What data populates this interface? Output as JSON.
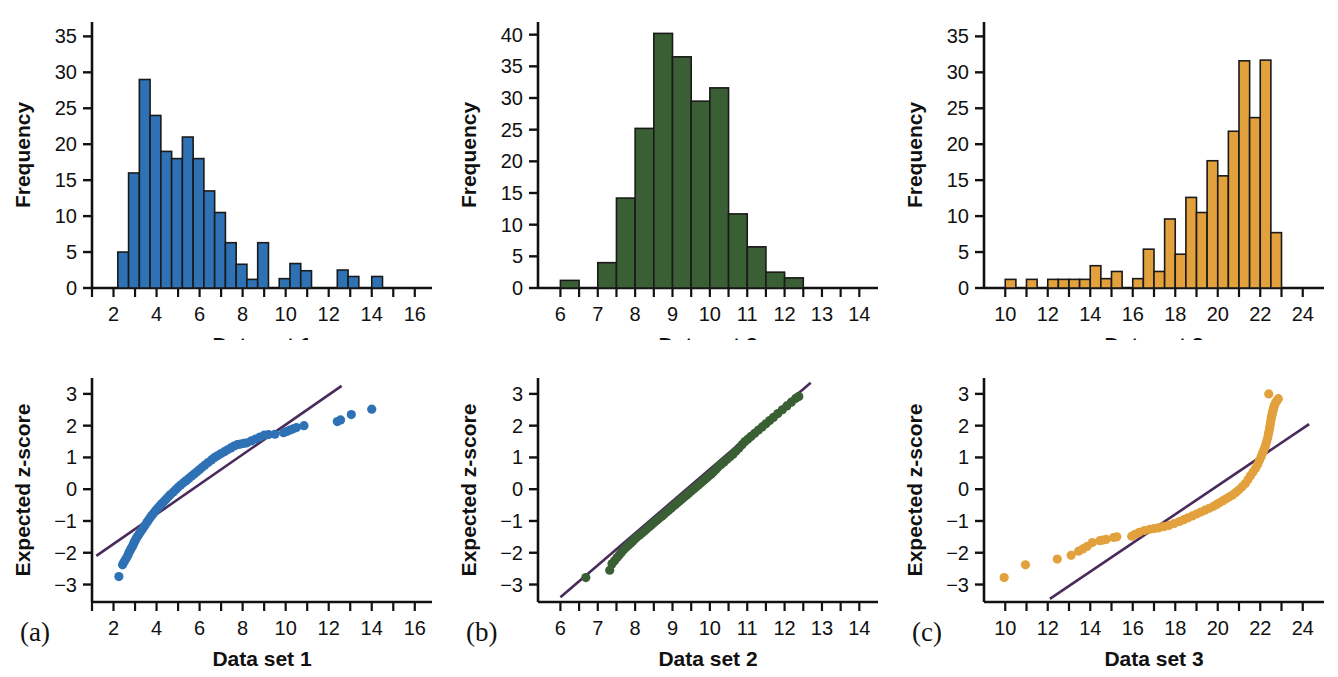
{
  "figure": {
    "panel_labels": [
      "(a)",
      "(b)",
      "(c)"
    ],
    "colors": {
      "dataset1": "#2E72B5",
      "dataset2": "#3A5F34",
      "dataset3": "#E2A13C",
      "bar_edge": "#1A1A1A",
      "reference_line": "#4A2A5A",
      "axis": "#111111"
    }
  },
  "chart_data": [
    {
      "type": "bar",
      "id": "histogram-1",
      "title": "",
      "xlabel": "Data set 1",
      "ylabel": "Frequency",
      "xlim": [
        1.0,
        16.8
      ],
      "ylim": [
        0,
        37
      ],
      "xticks": [
        2,
        4,
        6,
        8,
        10,
        12,
        14,
        16
      ],
      "xminorticks": [
        1,
        2,
        3,
        4,
        5,
        6,
        7,
        8,
        9,
        10,
        11,
        12,
        13,
        14,
        15,
        16
      ],
      "yticks": [
        0,
        5,
        10,
        15,
        20,
        25,
        30,
        35
      ],
      "bin_width": 0.5,
      "bin_starts": [
        2.2,
        2.7,
        3.2,
        3.7,
        4.2,
        4.7,
        5.2,
        5.7,
        6.2,
        6.7,
        7.2,
        7.7,
        8.2,
        8.7,
        9.7,
        10.2,
        10.7,
        12.4,
        12.9,
        14.0
      ],
      "values": [
        5,
        16,
        29,
        24,
        19,
        18,
        21,
        18,
        13.5,
        10.5,
        6.3,
        3.3,
        1.2,
        6.3,
        1.3,
        3.4,
        2.4,
        2.5,
        1.6,
        1.6
      ],
      "grid": false
    },
    {
      "type": "bar",
      "id": "histogram-2",
      "title": "",
      "xlabel": "Data set 2",
      "ylabel": "Frequency",
      "xlim": [
        5.4,
        14.5
      ],
      "ylim": [
        0,
        42
      ],
      "xticks": [
        6,
        7,
        8,
        9,
        10,
        11,
        12,
        13,
        14
      ],
      "xminorticks": [
        6,
        6.5,
        7,
        7.5,
        8,
        8.5,
        9,
        9.5,
        10,
        10.5,
        11,
        11.5,
        12,
        12.5,
        13,
        13.5,
        14
      ],
      "yticks": [
        0,
        5,
        10,
        15,
        20,
        25,
        30,
        35,
        40
      ],
      "bin_width": 0.5,
      "bin_starts": [
        6.0,
        7.0,
        7.5,
        8.0,
        8.5,
        9.0,
        9.5,
        10.0,
        10.5,
        11.0,
        11.5,
        12.0
      ],
      "values": [
        1.2,
        4.0,
        14.2,
        25.2,
        40.2,
        36.5,
        29.5,
        31.6,
        11.7,
        6.5,
        2.5,
        1.6
      ],
      "grid": false
    },
    {
      "type": "bar",
      "id": "histogram-3",
      "title": "",
      "xlabel": "Data set 3",
      "ylabel": "Frequency",
      "xlim": [
        9.0,
        25.0
      ],
      "ylim": [
        0,
        37
      ],
      "xticks": [
        10,
        12,
        14,
        16,
        18,
        20,
        22,
        24
      ],
      "xminorticks": [
        10,
        11,
        12,
        13,
        14,
        15,
        16,
        17,
        18,
        19,
        20,
        21,
        22,
        23,
        24
      ],
      "yticks": [
        0,
        5,
        10,
        15,
        20,
        25,
        30,
        35
      ],
      "bin_width": 0.5,
      "bin_starts": [
        10.0,
        11.0,
        12.0,
        12.5,
        13.0,
        13.5,
        14.0,
        14.5,
        15.0,
        16.0,
        16.5,
        17.0,
        17.5,
        18.0,
        18.5,
        19.0,
        19.5,
        20.0,
        20.5,
        21.0,
        21.5,
        22.0,
        22.5
      ],
      "values": [
        1.2,
        1.2,
        1.2,
        1.2,
        1.2,
        1.2,
        3.1,
        1.3,
        2.3,
        1.3,
        5.4,
        2.3,
        9.6,
        4.7,
        12.6,
        10.5,
        17.7,
        15.6,
        21.8,
        31.6,
        23.7,
        31.7,
        7.7
      ],
      "grid": false
    },
    {
      "type": "scatter",
      "id": "qqplot-1",
      "title": "",
      "xlabel": "Data set 1",
      "ylabel": "Expected z-score",
      "xlim": [
        1.0,
        16.8
      ],
      "ylim": [
        -3.55,
        3.5
      ],
      "xticks": [
        2,
        4,
        6,
        8,
        10,
        12,
        14,
        16
      ],
      "xminorticks": [
        1,
        2,
        3,
        4,
        5,
        6,
        7,
        8,
        9,
        10,
        11,
        12,
        13,
        14,
        15,
        16
      ],
      "yticks": [
        -3,
        -2,
        -1,
        0,
        1,
        2,
        3
      ],
      "reference_line": {
        "x1": 1.2,
        "y1": -2.1,
        "x2": 12.6,
        "y2": 3.25
      },
      "points_x": [
        2.25,
        2.42,
        2.48,
        2.55,
        2.62,
        2.68,
        2.72,
        2.78,
        2.82,
        2.88,
        2.92,
        2.96,
        3.0,
        3.05,
        3.1,
        3.16,
        3.22,
        3.3,
        3.38,
        3.46,
        3.55,
        3.62,
        3.7,
        3.78,
        3.86,
        3.95,
        4.05,
        4.15,
        4.25,
        4.35,
        4.45,
        4.55,
        4.65,
        4.78,
        4.9,
        5.0,
        5.12,
        5.25,
        5.38,
        5.5,
        5.62,
        5.75,
        5.88,
        6.0,
        6.12,
        6.25,
        6.4,
        6.55,
        6.7,
        6.85,
        7.0,
        7.15,
        7.3,
        7.45,
        7.6,
        7.75,
        7.9,
        8.05,
        8.2,
        8.4,
        8.6,
        8.8,
        9.0,
        9.2,
        9.5,
        9.9,
        10.05,
        10.2,
        10.35,
        10.5,
        10.85,
        12.4,
        12.55,
        13.05,
        14.0
      ],
      "points_y": [
        -2.75,
        -2.38,
        -2.3,
        -2.22,
        -2.14,
        -2.06,
        -1.99,
        -1.92,
        -1.86,
        -1.8,
        -1.74,
        -1.68,
        -1.62,
        -1.56,
        -1.5,
        -1.44,
        -1.38,
        -1.3,
        -1.22,
        -1.14,
        -1.05,
        -0.98,
        -0.9,
        -0.83,
        -0.76,
        -0.68,
        -0.6,
        -0.52,
        -0.45,
        -0.38,
        -0.31,
        -0.24,
        -0.17,
        -0.09,
        -0.01,
        0.06,
        0.13,
        0.2,
        0.27,
        0.34,
        0.41,
        0.48,
        0.55,
        0.62,
        0.69,
        0.76,
        0.84,
        0.92,
        1.0,
        1.06,
        1.12,
        1.18,
        1.24,
        1.3,
        1.36,
        1.4,
        1.42,
        1.44,
        1.46,
        1.52,
        1.58,
        1.64,
        1.7,
        1.72,
        1.73,
        1.78,
        1.82,
        1.86,
        1.9,
        1.94,
        2.0,
        2.13,
        2.18,
        2.35,
        2.52
      ],
      "grid": false
    },
    {
      "type": "scatter",
      "id": "qqplot-2",
      "title": "",
      "xlabel": "Data set 2",
      "ylabel": "Expected z-score",
      "xlim": [
        5.4,
        14.5
      ],
      "ylim": [
        -3.55,
        3.5
      ],
      "xticks": [
        6,
        7,
        8,
        9,
        10,
        11,
        12,
        13,
        14
      ],
      "xminorticks": [
        6,
        6.5,
        7,
        7.5,
        8,
        8.5,
        9,
        9.5,
        10,
        10.5,
        11,
        11.5,
        12,
        12.5,
        13,
        13.5,
        14
      ],
      "yticks": [
        -3,
        -2,
        -1,
        0,
        1,
        2,
        3
      ],
      "reference_line": {
        "x1": 6.0,
        "y1": -3.4,
        "x2": 12.7,
        "y2": 3.35
      },
      "points_x": [
        6.68,
        7.32,
        7.38,
        7.45,
        7.52,
        7.58,
        7.64,
        7.7,
        7.76,
        7.82,
        7.88,
        7.94,
        8.0,
        8.06,
        8.12,
        8.18,
        8.24,
        8.3,
        8.36,
        8.42,
        8.48,
        8.54,
        8.6,
        8.66,
        8.72,
        8.78,
        8.84,
        8.9,
        8.96,
        9.02,
        9.08,
        9.14,
        9.2,
        9.26,
        9.32,
        9.38,
        9.44,
        9.5,
        9.56,
        9.62,
        9.68,
        9.74,
        9.8,
        9.86,
        9.92,
        9.98,
        10.04,
        10.1,
        10.16,
        10.22,
        10.3,
        10.38,
        10.46,
        10.54,
        10.62,
        10.7,
        10.78,
        10.86,
        10.94,
        11.02,
        11.1,
        11.2,
        11.3,
        11.4,
        11.5,
        11.6,
        11.7,
        11.82,
        11.94,
        12.06,
        12.18,
        12.3,
        12.38
      ],
      "points_y": [
        -2.78,
        -2.55,
        -2.35,
        -2.25,
        -2.15,
        -2.06,
        -1.98,
        -1.9,
        -1.83,
        -1.76,
        -1.7,
        -1.63,
        -1.56,
        -1.5,
        -1.44,
        -1.38,
        -1.32,
        -1.26,
        -1.2,
        -1.14,
        -1.08,
        -1.02,
        -0.96,
        -0.9,
        -0.84,
        -0.78,
        -0.72,
        -0.66,
        -0.6,
        -0.54,
        -0.48,
        -0.42,
        -0.36,
        -0.3,
        -0.24,
        -0.18,
        -0.12,
        -0.06,
        0.0,
        0.06,
        0.12,
        0.18,
        0.24,
        0.3,
        0.36,
        0.42,
        0.48,
        0.55,
        0.62,
        0.7,
        0.78,
        0.86,
        0.94,
        1.02,
        1.1,
        1.2,
        1.3,
        1.4,
        1.5,
        1.58,
        1.66,
        1.76,
        1.86,
        1.96,
        2.06,
        2.16,
        2.26,
        2.38,
        2.5,
        2.62,
        2.74,
        2.86,
        2.92
      ],
      "grid": false
    },
    {
      "type": "scatter",
      "id": "qqplot-3",
      "title": "",
      "xlabel": "Data set 3",
      "ylabel": "Expected z-score",
      "xlim": [
        9.0,
        25.0
      ],
      "ylim": [
        -3.55,
        3.5
      ],
      "xticks": [
        10,
        12,
        14,
        16,
        18,
        20,
        22,
        24
      ],
      "xminorticks": [
        10,
        11,
        12,
        13,
        14,
        15,
        16,
        17,
        18,
        19,
        20,
        21,
        22,
        23,
        24
      ],
      "yticks": [
        -3,
        -2,
        -1,
        0,
        1,
        2,
        3
      ],
      "reference_line": {
        "x1": 12.1,
        "y1": -3.45,
        "x2": 24.3,
        "y2": 2.05
      },
      "points_x": [
        9.95,
        10.95,
        12.45,
        13.1,
        13.45,
        13.65,
        13.85,
        14.1,
        14.45,
        14.6,
        14.75,
        15.1,
        15.25,
        15.95,
        16.1,
        16.3,
        16.55,
        16.8,
        17.0,
        17.2,
        17.45,
        17.7,
        17.95,
        18.2,
        18.4,
        18.6,
        18.8,
        19.0,
        19.2,
        19.4,
        19.6,
        19.8,
        19.95,
        20.1,
        20.25,
        20.4,
        20.55,
        20.7,
        20.85,
        21.0,
        21.15,
        21.3,
        21.42,
        21.54,
        21.66,
        21.78,
        21.88,
        21.96,
        22.04,
        22.1,
        22.16,
        22.22,
        22.27,
        22.31,
        22.35,
        22.38,
        22.41,
        22.44,
        22.46,
        22.48,
        22.5,
        22.52,
        22.54,
        22.56,
        22.58,
        22.6,
        22.62,
        22.65,
        22.68,
        22.72,
        22.78,
        22.85,
        22.4
      ],
      "points_y": [
        -2.78,
        -2.38,
        -2.2,
        -2.08,
        -1.95,
        -1.88,
        -1.8,
        -1.68,
        -1.62,
        -1.6,
        -1.58,
        -1.52,
        -1.5,
        -1.48,
        -1.42,
        -1.36,
        -1.3,
        -1.26,
        -1.24,
        -1.22,
        -1.18,
        -1.14,
        -1.08,
        -1.02,
        -0.96,
        -0.9,
        -0.84,
        -0.78,
        -0.72,
        -0.66,
        -0.6,
        -0.54,
        -0.48,
        -0.42,
        -0.36,
        -0.3,
        -0.24,
        -0.18,
        -0.1,
        -0.02,
        0.08,
        0.18,
        0.3,
        0.42,
        0.54,
        0.66,
        0.78,
        0.9,
        1.02,
        1.12,
        1.22,
        1.32,
        1.42,
        1.52,
        1.62,
        1.72,
        1.82,
        1.92,
        2.0,
        2.08,
        2.16,
        2.24,
        2.3,
        2.36,
        2.42,
        2.48,
        2.54,
        2.6,
        2.66,
        2.72,
        2.78,
        2.85,
        3.0
      ],
      "grid": false
    }
  ]
}
